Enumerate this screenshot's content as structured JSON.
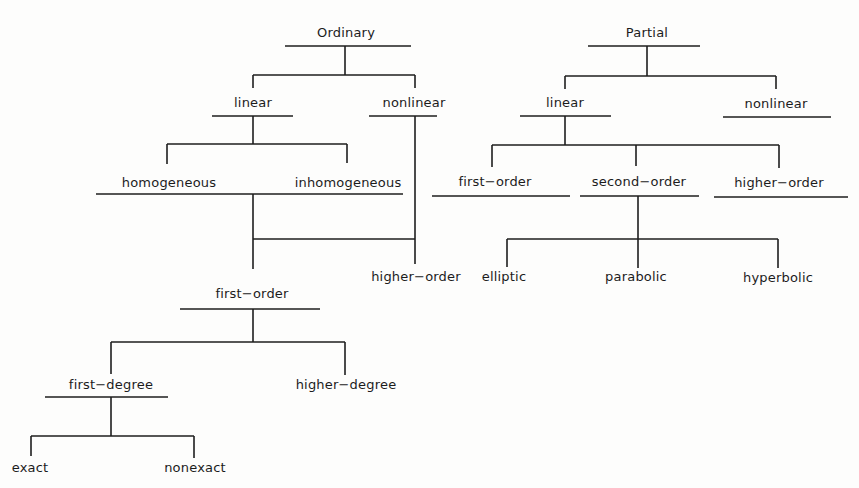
{
  "diagram": {
    "type": "classification-tree",
    "ordinary": {
      "root": "Ordinary",
      "linear": "linear",
      "nonlinear": "nonlinear",
      "homogeneous": "homogeneous",
      "inhomogeneous": "inhomogeneous",
      "higher_order": "higher−order",
      "first_order": "first−order",
      "first_degree": "first−degree",
      "higher_degree": "higher−degree",
      "exact": "exact",
      "nonexact": "nonexact"
    },
    "partial": {
      "root": "Partial",
      "linear": "linear",
      "nonlinear": "nonlinear",
      "first_order": "first−order",
      "second_order": "second−order",
      "higher_order": "higher−order",
      "elliptic": "elliptic",
      "parabolic": "parabolic",
      "hyperbolic": "hyperbolic"
    }
  }
}
